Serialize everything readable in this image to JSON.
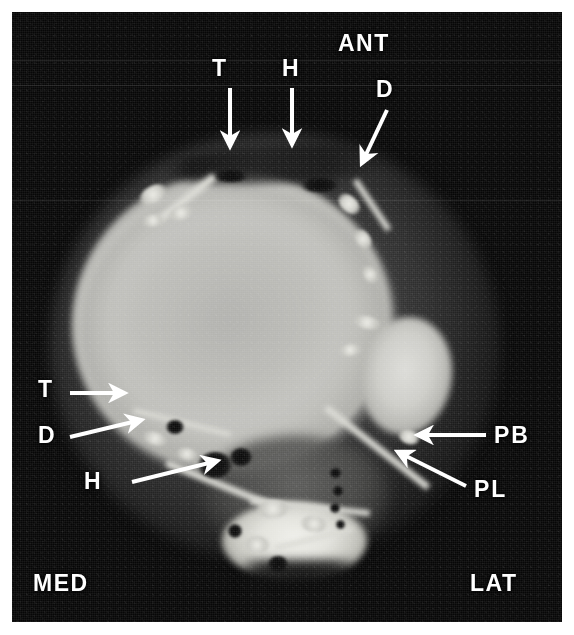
{
  "figure": {
    "modality": "MRI",
    "view": "axial",
    "region": "ankle",
    "background_color": "#070707",
    "annotation_color": "#ffffff",
    "paper_color": "#ffffff"
  },
  "orientation_labels": [
    {
      "id": "ant",
      "text": "ANT",
      "x": 338,
      "y": 32
    },
    {
      "id": "med",
      "text": "MED",
      "x": 33,
      "y": 572
    },
    {
      "id": "lat",
      "text": "LAT",
      "x": 470,
      "y": 572
    }
  ],
  "structure_labels": [
    {
      "id": "t-top",
      "text": "T",
      "x": 212,
      "y": 57
    },
    {
      "id": "h-top",
      "text": "H",
      "x": 282,
      "y": 57
    },
    {
      "id": "d-top",
      "text": "D",
      "x": 376,
      "y": 78
    },
    {
      "id": "t-left",
      "text": "T",
      "x": 38,
      "y": 378
    },
    {
      "id": "d-left",
      "text": "D",
      "x": 38,
      "y": 424
    },
    {
      "id": "h-left",
      "text": "H",
      "x": 84,
      "y": 470
    },
    {
      "id": "pb-right",
      "text": "PB",
      "x": 494,
      "y": 424
    },
    {
      "id": "pl-right",
      "text": "PL",
      "x": 474,
      "y": 478
    }
  ],
  "arrows": [
    {
      "id": "arrow-t-top",
      "label": "T",
      "x1": 230,
      "y1": 88,
      "x2": 230,
      "y2": 146
    },
    {
      "id": "arrow-h-top",
      "label": "H",
      "x1": 292,
      "y1": 88,
      "x2": 292,
      "y2": 144
    },
    {
      "id": "arrow-d-top",
      "label": "D",
      "x1": 387,
      "y1": 110,
      "x2": 362,
      "y2": 163
    },
    {
      "id": "arrow-t-left",
      "label": "T",
      "x1": 70,
      "y1": 393,
      "x2": 124,
      "y2": 393
    },
    {
      "id": "arrow-d-left",
      "label": "D",
      "x1": 70,
      "y1": 437,
      "x2": 141,
      "y2": 420
    },
    {
      "id": "arrow-h-left",
      "label": "H",
      "x1": 132,
      "y1": 482,
      "x2": 217,
      "y2": 461
    },
    {
      "id": "arrow-pb-right",
      "label": "PB",
      "x1": 486,
      "y1": 435,
      "x2": 418,
      "y2": 435
    },
    {
      "id": "arrow-pl-right",
      "label": "PL",
      "x1": 466,
      "y1": 486,
      "x2": 398,
      "y2": 452
    }
  ],
  "nodules": [
    {
      "x": 138,
      "y": 186,
      "w": 30,
      "h": 17,
      "r": -30
    },
    {
      "x": 168,
      "y": 206,
      "w": 26,
      "h": 14,
      "r": -18
    },
    {
      "x": 142,
      "y": 214,
      "w": 22,
      "h": 13,
      "r": -10
    },
    {
      "x": 336,
      "y": 196,
      "w": 26,
      "h": 16,
      "r": 42
    },
    {
      "x": 352,
      "y": 232,
      "w": 22,
      "h": 14,
      "r": 54
    },
    {
      "x": 360,
      "y": 268,
      "w": 20,
      "h": 13,
      "r": 62
    },
    {
      "x": 352,
      "y": 316,
      "w": 30,
      "h": 13,
      "r": 12
    },
    {
      "x": 338,
      "y": 344,
      "w": 24,
      "h": 12,
      "r": -8
    },
    {
      "x": 398,
      "y": 430,
      "w": 22,
      "h": 14,
      "r": 18
    },
    {
      "x": 142,
      "y": 432,
      "w": 26,
      "h": 13,
      "r": 18
    },
    {
      "x": 176,
      "y": 448,
      "w": 22,
      "h": 12,
      "r": 10
    },
    {
      "x": 256,
      "y": 500,
      "w": 34,
      "h": 18,
      "r": -4
    },
    {
      "x": 300,
      "y": 516,
      "w": 28,
      "h": 16,
      "r": 8
    },
    {
      "x": 244,
      "y": 536,
      "w": 26,
      "h": 18,
      "r": 0
    }
  ],
  "voids": [
    {
      "x": 198,
      "y": 452,
      "w": 34,
      "h": 26
    },
    {
      "x": 230,
      "y": 448,
      "w": 22,
      "h": 18
    },
    {
      "x": 166,
      "y": 420,
      "w": 18,
      "h": 14
    },
    {
      "x": 330,
      "y": 468,
      "w": 11,
      "h": 10
    },
    {
      "x": 333,
      "y": 486,
      "w": 10,
      "h": 10
    },
    {
      "x": 330,
      "y": 503,
      "w": 10,
      "h": 10
    },
    {
      "x": 336,
      "y": 520,
      "w": 9,
      "h": 9
    },
    {
      "x": 228,
      "y": 524,
      "w": 14,
      "h": 14
    },
    {
      "x": 268,
      "y": 556,
      "w": 20,
      "h": 16
    },
    {
      "x": 300,
      "y": 178,
      "w": 40,
      "h": 14
    },
    {
      "x": 214,
      "y": 170,
      "w": 34,
      "h": 12
    }
  ],
  "scanlines": [
    {
      "y": 60
    },
    {
      "y": 85
    },
    {
      "y": 200
    }
  ]
}
